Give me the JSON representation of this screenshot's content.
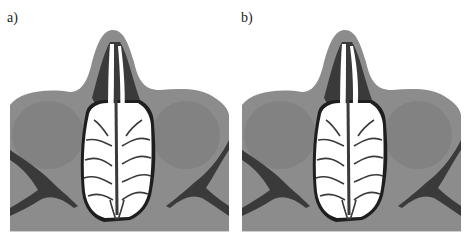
{
  "figure": {
    "panels": [
      {
        "id": "a",
        "label": "a)",
        "description": "Axial section of nasal cavity and paranasal sinuses, segmentation overlay (left septum view)"
      },
      {
        "id": "b",
        "label": "b)",
        "description": "Axial section of nasal cavity and paranasal sinuses, segmentation overlay (alternate view)"
      }
    ]
  },
  "colors": {
    "tissue": "#8c8c8c",
    "tissue_dark": "#7a7a7a",
    "air_dark": "#3a3a3a",
    "airway": "#ffffff",
    "outline": "#1e1e1e",
    "background": "#ffffff"
  }
}
